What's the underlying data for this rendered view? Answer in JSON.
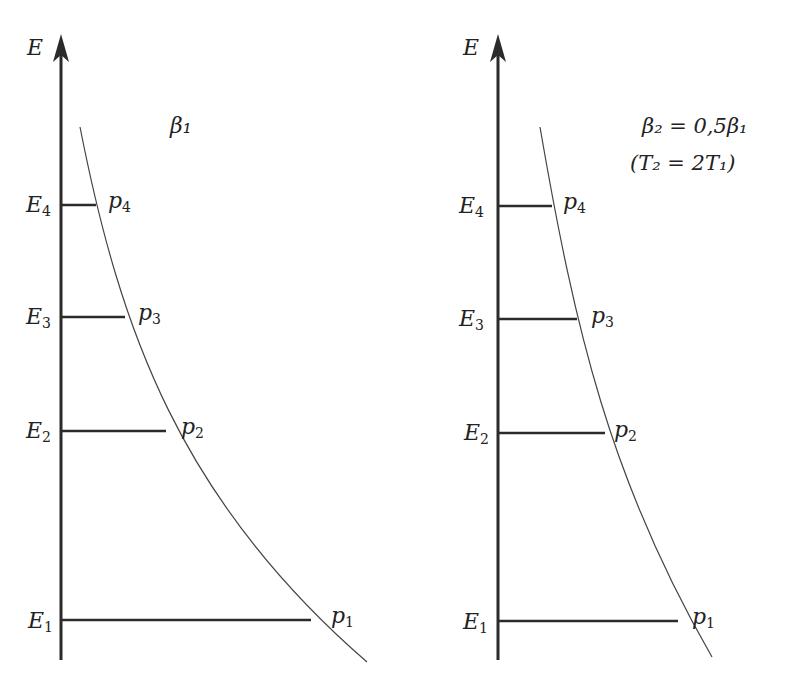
{
  "panels": [
    {
      "axis_label": "E",
      "title": "β₁",
      "levels": [
        {
          "label": "E",
          "sub": "4",
          "point": "p",
          "psub": "4"
        },
        {
          "label": "E",
          "sub": "3",
          "point": "p",
          "psub": "3"
        },
        {
          "label": "E",
          "sub": "2",
          "point": "p",
          "psub": "2"
        },
        {
          "label": "E",
          "sub": "1",
          "point": "p",
          "psub": "1"
        }
      ]
    },
    {
      "axis_label": "E",
      "title_line1": "β₂ = 0,5β₁",
      "title_line2": "(T₂ = 2T₁)",
      "levels": [
        {
          "label": "E",
          "sub": "4",
          "point": "p",
          "psub": "4"
        },
        {
          "label": "E",
          "sub": "3",
          "point": "p",
          "psub": "3"
        },
        {
          "label": "E",
          "sub": "2",
          "point": "p",
          "psub": "2"
        },
        {
          "label": "E",
          "sub": "1",
          "point": "p",
          "psub": "1"
        }
      ]
    }
  ],
  "colors": {
    "line": "#2b2b2b",
    "curve": "#444444"
  }
}
